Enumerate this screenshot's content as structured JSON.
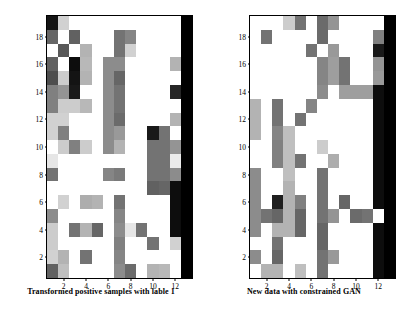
{
  "figure": {
    "background_color": "#ffffff",
    "panel_count": 2
  },
  "panels": [
    {
      "name": "left",
      "caption": "Transformed positive samples with lable 1"
    },
    {
      "name": "right",
      "caption": "New data with constrained GAN"
    }
  ],
  "chart_data": [
    {
      "type": "heatmap",
      "title": "Transformed positive samples with lable 1",
      "xlabel": "",
      "ylabel": "",
      "xlim": [
        0.5,
        13.5
      ],
      "ylim": [
        0.5,
        19.5
      ],
      "xticks": [
        2,
        4,
        6,
        8,
        10,
        12
      ],
      "yticks": [
        2,
        4,
        6,
        8,
        10,
        12,
        14,
        16,
        18
      ],
      "grid": false,
      "legend": "none",
      "colormap": "gray_r",
      "vmin": 0,
      "vmax": 1,
      "n_rows": 19,
      "n_cols": 13,
      "values": [
        [
          0.92,
          0.18,
          0.0,
          0.0,
          0.0,
          0.0,
          0.0,
          0.0,
          0.0,
          0.0,
          0.0,
          0.0,
          1.0
        ],
        [
          0.6,
          0.0,
          0.62,
          0.0,
          0.0,
          0.0,
          0.55,
          0.48,
          0.0,
          0.0,
          0.0,
          0.0,
          1.0
        ],
        [
          0.0,
          0.65,
          0.0,
          0.3,
          0.0,
          0.0,
          0.55,
          0.18,
          0.0,
          0.0,
          0.0,
          0.0,
          1.0
        ],
        [
          0.62,
          0.0,
          0.95,
          0.28,
          0.0,
          0.45,
          0.45,
          0.0,
          0.0,
          0.0,
          0.0,
          0.3,
          1.0
        ],
        [
          0.7,
          0.2,
          0.92,
          0.3,
          0.0,
          0.45,
          0.6,
          0.0,
          0.0,
          0.0,
          0.0,
          0.0,
          1.0
        ],
        [
          0.5,
          0.42,
          0.9,
          0.0,
          0.0,
          0.45,
          0.55,
          0.0,
          0.0,
          0.0,
          0.0,
          0.85,
          1.0
        ],
        [
          0.5,
          0.2,
          0.2,
          0.28,
          0.0,
          0.45,
          0.55,
          0.0,
          0.0,
          0.0,
          0.0,
          0.0,
          1.0
        ],
        [
          0.18,
          0.18,
          0.0,
          0.0,
          0.0,
          0.45,
          0.58,
          0.0,
          0.0,
          0.0,
          0.0,
          0.3,
          1.0
        ],
        [
          0.18,
          0.5,
          0.0,
          0.0,
          0.0,
          0.45,
          0.4,
          0.0,
          0.0,
          0.9,
          0.55,
          0.0,
          1.0
        ],
        [
          0.0,
          0.2,
          0.5,
          0.2,
          0.0,
          0.45,
          0.3,
          0.0,
          0.0,
          0.55,
          0.55,
          0.42,
          1.0
        ],
        [
          0.1,
          0.0,
          0.0,
          0.0,
          0.0,
          0.0,
          0.0,
          0.0,
          0.0,
          0.55,
          0.55,
          0.08,
          1.0
        ],
        [
          0.55,
          0.0,
          0.0,
          0.0,
          0.0,
          0.48,
          0.52,
          0.0,
          0.0,
          0.55,
          0.55,
          0.45,
          1.0
        ],
        [
          0.0,
          0.0,
          0.0,
          0.0,
          0.0,
          0.0,
          0.0,
          0.0,
          0.0,
          0.62,
          0.6,
          0.95,
          1.0
        ],
        [
          0.0,
          0.18,
          0.0,
          0.32,
          0.3,
          0.0,
          0.55,
          0.0,
          0.0,
          0.0,
          0.0,
          0.95,
          1.0
        ],
        [
          0.45,
          0.0,
          0.0,
          0.0,
          0.0,
          0.0,
          0.48,
          0.0,
          0.0,
          0.0,
          0.0,
          0.95,
          1.0
        ],
        [
          0.2,
          0.0,
          0.55,
          0.3,
          0.6,
          0.0,
          0.45,
          0.1,
          0.55,
          0.0,
          0.0,
          0.95,
          1.0
        ],
        [
          0.2,
          0.0,
          0.0,
          0.0,
          0.0,
          0.0,
          0.5,
          0.0,
          0.0,
          0.55,
          0.0,
          0.18,
          1.0
        ],
        [
          0.18,
          0.3,
          0.0,
          0.55,
          0.0,
          0.0,
          0.48,
          0.0,
          0.0,
          0.0,
          0.0,
          0.0,
          1.0
        ],
        [
          0.62,
          0.25,
          0.0,
          0.0,
          0.0,
          0.0,
          0.45,
          0.58,
          0.0,
          0.3,
          0.28,
          0.0,
          1.0
        ]
      ]
    },
    {
      "type": "heatmap",
      "title": "New data with constrained GAN",
      "xlabel": "",
      "ylabel": "",
      "xlim": [
        0.5,
        13.5
      ],
      "ylim": [
        0.5,
        19.5
      ],
      "xticks": [
        2,
        4,
        6,
        8,
        10,
        12
      ],
      "yticks": [
        2,
        4,
        6,
        8,
        10,
        12,
        14,
        16,
        18
      ],
      "grid": false,
      "legend": "none",
      "colormap": "gray_r",
      "vmin": 0,
      "vmax": 1,
      "n_rows": 19,
      "n_cols": 13,
      "values": [
        [
          0.0,
          0.0,
          0.0,
          0.2,
          0.55,
          0.0,
          0.58,
          0.42,
          0.0,
          0.0,
          0.0,
          0.0,
          1.0
        ],
        [
          0.0,
          0.55,
          0.0,
          0.0,
          0.0,
          0.0,
          0.58,
          0.0,
          0.0,
          0.0,
          0.0,
          0.5,
          1.0
        ],
        [
          0.0,
          0.0,
          0.0,
          0.0,
          0.0,
          0.55,
          0.0,
          0.4,
          0.0,
          0.0,
          0.0,
          0.9,
          1.0
        ],
        [
          0.0,
          0.0,
          0.0,
          0.0,
          0.0,
          0.0,
          0.48,
          0.38,
          0.55,
          0.0,
          0.0,
          0.42,
          1.0
        ],
        [
          0.0,
          0.0,
          0.0,
          0.0,
          0.0,
          0.0,
          0.48,
          0.38,
          0.55,
          0.0,
          0.0,
          0.4,
          1.0
        ],
        [
          0.0,
          0.0,
          0.0,
          0.0,
          0.0,
          0.0,
          0.45,
          0.0,
          0.38,
          0.38,
          0.38,
          0.95,
          1.0
        ],
        [
          0.3,
          0.0,
          0.55,
          0.0,
          0.0,
          0.48,
          0.0,
          0.0,
          0.0,
          0.0,
          0.0,
          0.95,
          1.0
        ],
        [
          0.3,
          0.0,
          0.55,
          0.0,
          0.55,
          0.0,
          0.0,
          0.0,
          0.0,
          0.0,
          0.0,
          0.95,
          1.0
        ],
        [
          0.3,
          0.0,
          0.48,
          0.25,
          0.0,
          0.0,
          0.0,
          0.0,
          0.0,
          0.0,
          0.0,
          0.95,
          1.0
        ],
        [
          0.0,
          0.0,
          0.5,
          0.25,
          0.0,
          0.0,
          0.2,
          0.0,
          0.0,
          0.0,
          0.0,
          0.95,
          1.0
        ],
        [
          0.0,
          0.0,
          0.5,
          0.25,
          0.55,
          0.0,
          0.0,
          0.32,
          0.0,
          0.0,
          0.0,
          0.95,
          1.0
        ],
        [
          0.45,
          0.0,
          0.0,
          0.25,
          0.0,
          0.0,
          0.55,
          0.0,
          0.0,
          0.0,
          0.0,
          0.95,
          1.0
        ],
        [
          0.45,
          0.0,
          0.0,
          0.3,
          0.0,
          0.0,
          0.55,
          0.0,
          0.0,
          0.0,
          0.0,
          0.95,
          1.0
        ],
        [
          0.45,
          0.0,
          0.88,
          0.3,
          0.5,
          0.0,
          0.55,
          0.0,
          0.6,
          0.0,
          0.0,
          0.95,
          1.0
        ],
        [
          0.45,
          0.55,
          0.6,
          0.3,
          0.6,
          0.0,
          0.55,
          0.42,
          0.0,
          0.58,
          0.55,
          0.0,
          1.0
        ],
        [
          0.45,
          0.0,
          0.3,
          0.3,
          0.6,
          0.0,
          0.6,
          0.0,
          0.0,
          0.0,
          0.0,
          0.95,
          1.0
        ],
        [
          0.0,
          0.0,
          0.55,
          0.0,
          0.0,
          0.0,
          0.6,
          0.0,
          0.0,
          0.0,
          0.0,
          0.95,
          1.0
        ],
        [
          0.45,
          0.0,
          0.6,
          0.0,
          0.0,
          0.0,
          0.55,
          0.4,
          0.0,
          0.0,
          0.0,
          0.95,
          1.0
        ],
        [
          0.0,
          0.3,
          0.3,
          0.0,
          0.25,
          0.0,
          0.55,
          0.0,
          0.0,
          0.0,
          0.0,
          0.95,
          1.0
        ]
      ]
    }
  ]
}
